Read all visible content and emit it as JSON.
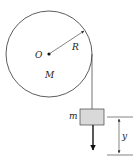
{
  "diagram": {
    "labels": {
      "center": "O",
      "radius": "R",
      "disk_mass": "M",
      "block_mass": "m",
      "displacement": "y"
    },
    "colors": {
      "stroke": "#333333",
      "block_fill": "#d9d9d9",
      "background": "#ffffff"
    }
  }
}
